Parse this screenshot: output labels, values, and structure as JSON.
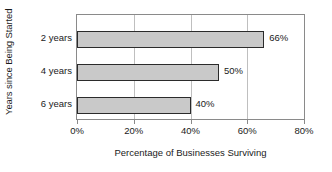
{
  "chart_data": {
    "type": "bar",
    "orientation": "horizontal",
    "title": "",
    "xlabel": "Percentage of Businesses Surviving",
    "ylabel": "Years since Being Started",
    "categories": [
      "2 years",
      "4 years",
      "6 years"
    ],
    "values": [
      66,
      50,
      40
    ],
    "data_labels": [
      "66%",
      "50%",
      "40%"
    ],
    "xlim": [
      0,
      80
    ],
    "xticks": [
      0,
      20,
      40,
      60,
      80
    ],
    "xtick_labels": [
      "0%",
      "20%",
      "40%",
      "60%",
      "80%"
    ],
    "grid": true,
    "grid_axis": "x",
    "legend": false,
    "legend_position": "none",
    "bar_fill_color": "#c9c9c9",
    "bar_border_color": "#2b2b2b",
    "gridline_color": "#bfbfbf",
    "axis_border_color": "#8a8a8a",
    "background_color": "#ffffff",
    "text_color": "#1a1a1a"
  }
}
